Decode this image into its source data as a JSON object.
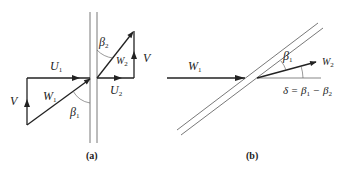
{
  "figure": {
    "panel_a": {
      "caption": "(a)",
      "labels": {
        "U1": {
          "main": "U",
          "sub": "1"
        },
        "U2": {
          "main": "U",
          "sub": "2"
        },
        "W1": {
          "main": "W",
          "sub": "1"
        },
        "W2": {
          "main": "W",
          "sub": "2"
        },
        "V_left": {
          "main": "V"
        },
        "V_right": {
          "main": "V"
        },
        "beta1": {
          "main": "β",
          "sub": "1"
        },
        "beta2": {
          "main": "β",
          "sub": "2"
        }
      }
    },
    "panel_b": {
      "caption": "(b)",
      "labels": {
        "W1": {
          "main": "W",
          "sub": "1"
        },
        "W2": {
          "main": "W",
          "sub": "2"
        },
        "beta1": {
          "main": "β",
          "sub": "1"
        },
        "delta_eq": {
          "lhs": "δ = β",
          "sub1": "1",
          "mid": " − β",
          "sub2": "2"
        }
      }
    },
    "colors": {
      "stroke": "#222222",
      "thin": "#555555",
      "background": "#ffffff"
    }
  }
}
